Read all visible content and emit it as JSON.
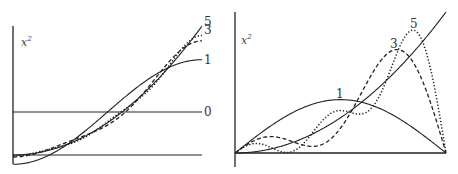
{
  "chart_data": [
    {
      "type": "line",
      "title": "",
      "ylabel": "x^2",
      "ylabel_base": "x",
      "ylabel_exp": "2",
      "xlim": [
        0,
        1
      ],
      "ylim": [
        -0.07,
        1.0
      ],
      "grid": false,
      "description": "Cosine-series partial sums of x^2 on [0,1]",
      "series": [
        {
          "name": "x^2",
          "style": "solid",
          "label": ""
        },
        {
          "name": "N=0",
          "style": "solid",
          "label": "0",
          "terms": 0
        },
        {
          "name": "N=1",
          "style": "solid",
          "label": "1",
          "terms": 1
        },
        {
          "name": "N=3",
          "style": "dashed",
          "label": "3",
          "terms": 3
        },
        {
          "name": "N=5",
          "style": "dotted",
          "label": "5",
          "terms": 5
        }
      ],
      "reference_line": {
        "y": 0
      }
    },
    {
      "type": "line",
      "title": "",
      "ylabel": "x^2",
      "ylabel_base": "x",
      "ylabel_exp": "2",
      "xlim": [
        0,
        1
      ],
      "ylim": [
        0,
        1.0
      ],
      "grid": false,
      "description": "Sine-series partial sums of x^2 on [0,1]",
      "series": [
        {
          "name": "x^2",
          "style": "solid",
          "label": ""
        },
        {
          "name": "N=1",
          "style": "solid",
          "label": "1",
          "terms": 1
        },
        {
          "name": "N=3",
          "style": "dashed",
          "label": "3",
          "terms": 3
        },
        {
          "name": "N=5",
          "style": "dotted",
          "label": "5",
          "terms": 5
        }
      ],
      "reference_line": {
        "y": 0
      }
    }
  ]
}
